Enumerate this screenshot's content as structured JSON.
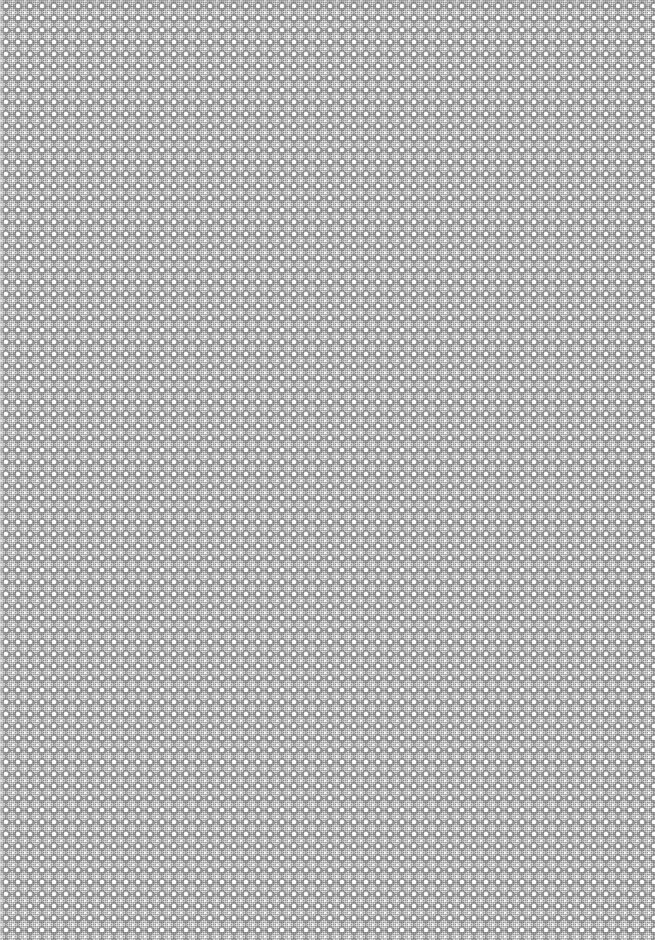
{
  "image": {
    "description": "Uniform repeating gray diamond lattice texture",
    "pattern": {
      "type": "diamond-lattice",
      "period_px": 12,
      "colors": {
        "base": "#b4b4b4",
        "diamond": "#6e6e6e",
        "dot": "#ffffff"
      }
    }
  }
}
